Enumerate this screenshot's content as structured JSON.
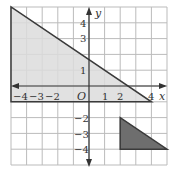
{
  "graph": {
    "origin_label": "O",
    "x_axis_label": "x",
    "y_axis_label": "y",
    "x_range": [
      -5,
      5
    ],
    "y_range": [
      -5,
      5
    ],
    "x_tick_labels": [
      "−4",
      "−3",
      "−2",
      "1",
      "2",
      "4"
    ],
    "y_tick_labels": [
      "4",
      "3",
      "1",
      "−2",
      "−3",
      "−4"
    ],
    "colors": {
      "grid": "#bbbbbb",
      "axis": "#333333",
      "large_triangle_fill": "#dcdcdc",
      "small_triangle_fill": "#6e6e6e",
      "outline": "#3a3a3a"
    },
    "shapes": [
      {
        "name": "large-triangle",
        "vertices": [
          [
            -5,
            5
          ],
          [
            -5,
            -1
          ],
          [
            4,
            -1
          ]
        ],
        "fill": "light gray"
      },
      {
        "name": "small-triangle",
        "vertices": [
          [
            2,
            -2
          ],
          [
            2,
            -4
          ],
          [
            5,
            -4
          ]
        ],
        "fill": "dark gray"
      }
    ]
  }
}
